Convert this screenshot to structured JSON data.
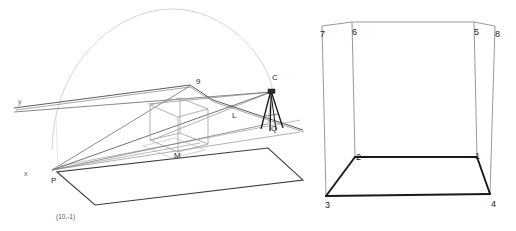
{
  "figure": {
    "background_color": "#ffffff",
    "width": 516,
    "height": 231
  },
  "left_panel": {
    "name": "perspective-scene-panel",
    "description": "Perspective view of a ground plane with a wireframe cube, a camera on a tripod, projection rays and a dome arc",
    "stroke_colors": {
      "ground_plane": "#3a3a3a",
      "dome_arc": "#c9c9c9",
      "cube_wireframe": "#9a9a9a",
      "rays": "#4a4a4a",
      "tripod": "#1a1a1a"
    },
    "labels": [
      {
        "id": "y-axis",
        "text": "y"
      },
      {
        "id": "x-axis",
        "text": "x"
      },
      {
        "id": "point-p",
        "text": "P"
      },
      {
        "id": "point-c",
        "text": "C"
      },
      {
        "id": "point-q",
        "text": "Q"
      },
      {
        "id": "point-l",
        "text": "L"
      },
      {
        "id": "point-m",
        "text": "M"
      },
      {
        "id": "point-9",
        "text": "9"
      },
      {
        "id": "coordinate-pair",
        "text": "(10,-1)"
      }
    ]
  },
  "right_panel": {
    "name": "numbered-box-panel",
    "description": "Wireframe box with eight numbered vertices, bottom face edges emphasised",
    "stroke_colors": {
      "thin_edges": "#8c8c8c",
      "thick_edges": "#1a1a1a"
    },
    "vertex_labels": [
      {
        "id": "vertex-1",
        "text": "1"
      },
      {
        "id": "vertex-2",
        "text": "2"
      },
      {
        "id": "vertex-3",
        "text": "3"
      },
      {
        "id": "vertex-4",
        "text": "4"
      },
      {
        "id": "vertex-5",
        "text": "5"
      },
      {
        "id": "vertex-6",
        "text": "6"
      },
      {
        "id": "vertex-7",
        "text": "7"
      },
      {
        "id": "vertex-8",
        "text": "8"
      }
    ]
  }
}
